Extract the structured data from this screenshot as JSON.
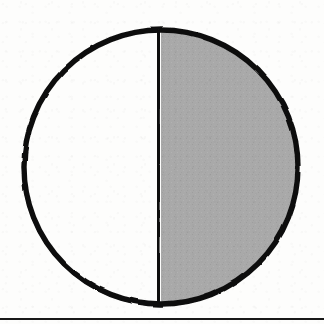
{
  "page": {
    "kind": "scanned-document-figure",
    "width": 324,
    "height": 324,
    "background_color": "#fdfdfc",
    "has_text": false,
    "caption": ""
  },
  "figure": {
    "name": "half-shaded-circle",
    "style": "hand-drawn ink on paper, photocopied",
    "circle": {
      "center_x": 161,
      "center_y": 167,
      "radius": 137,
      "diameter": 274,
      "outline_color": "#111111",
      "outline_width": 5
    },
    "divider": {
      "name": "vertical-diameter-line",
      "x": 158,
      "y_top": 31,
      "y_bottom": 304,
      "color": "#111111",
      "width": 5
    },
    "halves": [
      {
        "name": "left-half",
        "side": "left",
        "fill": "none",
        "fill_color": "#fdfdfc",
        "fraction": 0.5,
        "label": ""
      },
      {
        "name": "right-half",
        "side": "right",
        "fill": "shaded",
        "fill_color": "#a9a9a9",
        "fraction": 0.5,
        "label": ""
      }
    ]
  },
  "page_rule": {
    "name": "bottom-horizontal-rule",
    "y": 318,
    "thickness": 2,
    "color": "#181818",
    "x_start": 0,
    "x_end": 324
  }
}
